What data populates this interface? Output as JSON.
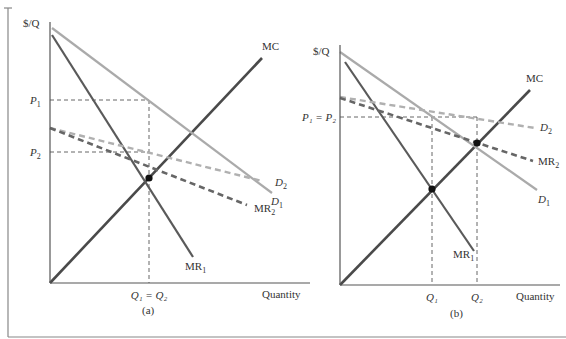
{
  "figure": {
    "frame": {
      "left_x": 8,
      "top_y": 8,
      "bottom_y": 337,
      "right_x": 566,
      "color": "#888888"
    },
    "colors": {
      "axis": "#555555",
      "mc": "#4a4a4a",
      "mr1": "#5a5a5a",
      "d1": "#aaaaaa",
      "d2": "#b0b0b0",
      "mr2": "#666666",
      "guide": "#555555",
      "dot": "#111111"
    }
  },
  "panels": [
    {
      "id": "a",
      "caption": "(a)",
      "y_axis_label": "$/Q",
      "x_axis_label": "Quantity",
      "origin": [
        50,
        283
      ],
      "y_top": 22,
      "x_end": 310,
      "price_labels": [
        {
          "text": "P",
          "sub": "1",
          "y": 100
        },
        {
          "text": "P",
          "sub": "2",
          "y": 152
        }
      ],
      "quantity_labels": [
        {
          "text": "Q₁ = Q₂",
          "x": 149
        }
      ],
      "curves": {
        "MC": {
          "from": [
            50,
            283
          ],
          "to": [
            262,
            58
          ],
          "label": "MC",
          "label_pos": [
            262,
            50
          ]
        },
        "D1": {
          "from": [
            52,
            28
          ],
          "to": [
            272,
            193
          ],
          "label": "D",
          "sub": "1",
          "label_pos": [
            271,
            205
          ]
        },
        "MR1": {
          "from": [
            52,
            35
          ],
          "to": [
            193,
            257
          ],
          "label": "MR",
          "sub": "1",
          "label_pos": [
            185,
            270
          ]
        },
        "D2": {
          "from": [
            50,
            128
          ],
          "to": [
            262,
            181
          ],
          "label": "D",
          "sub": "2",
          "label_pos": [
            275,
            186
          ]
        },
        "MR2": {
          "from": [
            50,
            128
          ],
          "to": [
            247,
            205
          ],
          "label": "MR",
          "sub": "2",
          "label_pos": [
            254,
            212
          ]
        }
      },
      "guides": [
        {
          "from": [
            50,
            100
          ],
          "to": [
            149,
            100
          ]
        },
        {
          "from": [
            50,
            152
          ],
          "to": [
            149,
            152
          ]
        },
        {
          "from": [
            149,
            100
          ],
          "to": [
            149,
            283
          ]
        }
      ],
      "dots": [
        [
          149,
          178
        ]
      ]
    },
    {
      "id": "b",
      "caption": "(b)",
      "y_axis_label": "$/Q",
      "x_axis_label": "Quantity",
      "origin": [
        340,
        285
      ],
      "y_top": 45,
      "x_end": 560,
      "price_labels": [
        {
          "text": "P₁ = P₂",
          "y": 117
        }
      ],
      "quantity_labels": [
        {
          "text": "Q₁",
          "x": 432
        },
        {
          "text": "Q₂",
          "x": 477
        }
      ],
      "curves": {
        "MC": {
          "from": [
            340,
            285
          ],
          "to": [
            530,
            90
          ],
          "label": "MC",
          "label_pos": [
            526,
            82
          ]
        },
        "D1": {
          "from": [
            340,
            52
          ],
          "to": [
            537,
            190
          ],
          "label": "D",
          "sub": "1",
          "label_pos": [
            538,
            203
          ]
        },
        "MR1": {
          "from": [
            345,
            62
          ],
          "to": [
            474,
            251
          ],
          "label": "MR",
          "sub": "1",
          "label_pos": [
            453,
            258
          ]
        },
        "D2": {
          "from": [
            340,
            97
          ],
          "to": [
            535,
            128
          ],
          "label": "D",
          "sub": "2",
          "label_pos": [
            540,
            131
          ]
        },
        "MR2": {
          "from": [
            340,
            98
          ],
          "to": [
            533,
            161
          ],
          "label": "MR",
          "sub": "2",
          "label_pos": [
            538,
            165
          ]
        }
      },
      "guides": [
        {
          "from": [
            340,
            117
          ],
          "to": [
            477,
            117
          ]
        },
        {
          "from": [
            432,
            117
          ],
          "to": [
            432,
            285
          ]
        },
        {
          "from": [
            477,
            117
          ],
          "to": [
            477,
            285
          ]
        }
      ],
      "dots": [
        [
          432,
          189
        ],
        [
          477,
          143
        ]
      ]
    }
  ]
}
